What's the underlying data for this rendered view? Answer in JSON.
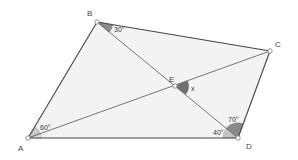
{
  "diagram": {
    "colors": {
      "fill": "#f3f3f3",
      "edge": "#444444",
      "diagonal": "#666666",
      "angle_dark": "#7a7a7a",
      "angle_light": "#c4c4c4",
      "point_fill": "#ffffff",
      "point_stroke": "#777777"
    },
    "points": {
      "A": {
        "label": "A",
        "x": 28,
        "y": 138
      },
      "B": {
        "label": "B",
        "x": 97,
        "y": 22
      },
      "C": {
        "label": "C",
        "x": 270,
        "y": 51
      },
      "D": {
        "label": "D",
        "x": 238,
        "y": 138
      },
      "E": {
        "label": "E",
        "x": 175,
        "y": 86
      }
    },
    "segments": [
      {
        "from": "A",
        "to": "B",
        "type": "edge"
      },
      {
        "from": "B",
        "to": "C",
        "type": "edge"
      },
      {
        "from": "C",
        "to": "D",
        "type": "edge"
      },
      {
        "from": "D",
        "to": "A",
        "type": "edge"
      },
      {
        "from": "A",
        "to": "C",
        "type": "diagonal"
      },
      {
        "from": "B",
        "to": "D",
        "type": "diagonal"
      }
    ],
    "angles": [
      {
        "vertex": "A",
        "label": "60°",
        "between": [
          "AB",
          "AC"
        ]
      },
      {
        "vertex": "B",
        "label": "30°",
        "between": [
          "BC",
          "BD"
        ]
      },
      {
        "vertex": "D",
        "label": "70°",
        "between": [
          "DB",
          "DC"
        ]
      },
      {
        "vertex": "D",
        "label": "40°",
        "between": [
          "DA",
          "DB"
        ]
      },
      {
        "vertex": "E",
        "label": "x",
        "between": [
          "EC",
          "ED"
        ]
      }
    ],
    "labels": {
      "A": "A",
      "B": "B",
      "C": "C",
      "D": "D",
      "E": "E",
      "angle_A": "60°",
      "angle_B": "30°",
      "angle_D_upper": "70°",
      "angle_D_lower": "40°",
      "angle_E": "x"
    }
  }
}
